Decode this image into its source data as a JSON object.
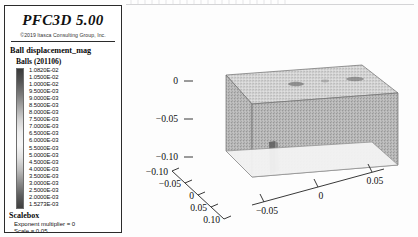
{
  "window": {
    "background": "#fdfdfd"
  },
  "legend": {
    "brand": "PFC3D 5.00",
    "copyright": "©2019 Itasca Consulting Group, Inc.",
    "title": "Ball displacement_mag",
    "subtitle": "Balls (201106)",
    "scale_values": [
      "1.0820E-02",
      "1.0500E-02",
      "1.0000E-02",
      "9.5000E-03",
      "9.0000E-03",
      "8.5000E-03",
      "8.0000E-03",
      "7.5000E-03",
      "7.0000E-03",
      "6.5000E-03",
      "6.0000E-03",
      "5.5000E-03",
      "5.0000E-03",
      "4.5000E-03",
      "4.0000E-03",
      "3.5000E-03",
      "3.0000E-03",
      "2.5000E-03",
      "2.0000E-03",
      "1.5273E-03"
    ],
    "colorbar_stops": [
      "#3a3a3a",
      "#555555",
      "#7a7a7a",
      "#a6a6a6",
      "#d2d2d2",
      "#eeeeee",
      "#f6f6f6",
      "#e2e2e2",
      "#bdbdbd",
      "#8c8c8c",
      "#5e5e5e",
      "#3f3f3f"
    ],
    "scalebox": {
      "heading": "Scalebox",
      "exponent_multiplier": "Exponent multiplier = 0",
      "scale": "Scale = 0.05"
    }
  },
  "chart_data": {
    "type": "scatter",
    "title": "",
    "subtitle": "",
    "render": "3d-particle-block",
    "xlabel": "",
    "ylabel": "",
    "zlabel": "",
    "axes": {
      "vertical": {
        "name": "z",
        "ticks": [
          0,
          -0.05,
          -0.1
        ],
        "tick_labels": [
          "0",
          "-0.05",
          "-0.10"
        ],
        "range": [
          -0.12,
          0.01
        ]
      },
      "left_horizontal": {
        "name": "x",
        "ticks": [
          -0.1,
          -0.05,
          0,
          0.05,
          0.1
        ],
        "tick_labels": [
          "-0.10",
          "-0.05",
          "0",
          "0.05",
          "0.10"
        ],
        "range": [
          -0.12,
          0.12
        ]
      },
      "right_horizontal": {
        "name": "y",
        "ticks": [
          -0.05,
          0,
          0.05
        ],
        "tick_labels": [
          "-0.05",
          "0",
          "0.05"
        ],
        "range": [
          -0.07,
          0.07
        ]
      }
    },
    "grid": false,
    "legend_position": "left-panel",
    "colormap": "grayscale",
    "value_range": [
      0.0015273,
      0.01082
    ],
    "value_unit": "m",
    "n_points": 201106
  }
}
